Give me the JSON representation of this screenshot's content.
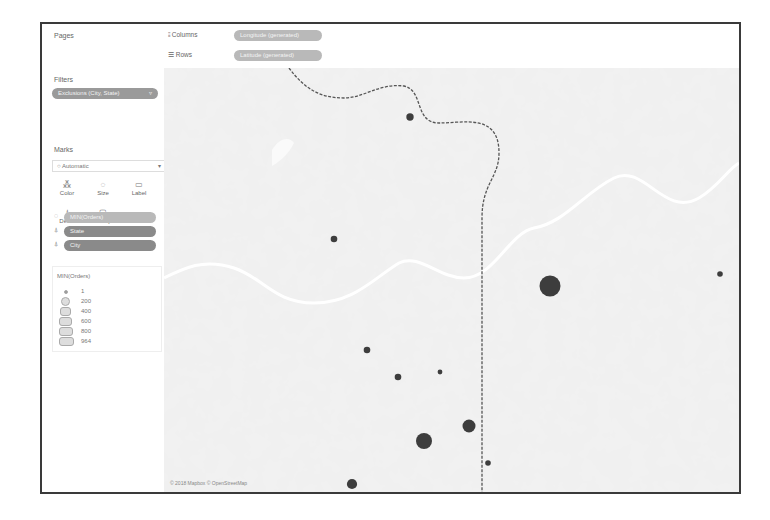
{
  "sidebar": {
    "pages_title": "Pages",
    "filters_title": "Filters",
    "filter_pill": "Exclusions (City, State)",
    "filter_icon": "filter-icon",
    "marks_title": "Marks",
    "mark_type": "Automatic",
    "mark_buttons": [
      {
        "label": "Color",
        "icon": "color-icon"
      },
      {
        "label": "Size",
        "icon": "size-icon"
      },
      {
        "label": "Label",
        "icon": "label-icon"
      },
      {
        "label": "Detail",
        "icon": "detail-icon"
      },
      {
        "label": "Tooltip",
        "icon": "tooltip-icon"
      }
    ],
    "mark_pills": [
      {
        "label": "MIN(Orders)",
        "icon": "size-icon"
      },
      {
        "label": "State",
        "icon": "detail-icon"
      },
      {
        "label": "City",
        "icon": "detail-icon"
      }
    ],
    "legend": {
      "title": "MIN(Orders)",
      "items": [
        "1",
        "200",
        "400",
        "600",
        "800",
        "964"
      ]
    }
  },
  "shelves": {
    "columns_label": "Columns",
    "columns_pill": "Longitude (generated)",
    "rows_label": "Rows",
    "rows_pill": "Latitude (generated)"
  },
  "map": {
    "attribution": "© 2018 Mapbox © OpenStreetMap",
    "mark_color": "#3d3d3d",
    "points": [
      {
        "name": "point-1",
        "orders": 60
      },
      {
        "name": "point-2",
        "orders": 40
      },
      {
        "name": "point-3",
        "orders": 964
      },
      {
        "name": "point-4",
        "orders": 20
      },
      {
        "name": "point-5",
        "orders": 40
      },
      {
        "name": "point-6",
        "orders": 40
      },
      {
        "name": "point-7",
        "orders": 10
      },
      {
        "name": "point-8",
        "orders": 500
      },
      {
        "name": "point-9",
        "orders": 300
      },
      {
        "name": "point-10",
        "orders": 20
      },
      {
        "name": "point-11",
        "orders": 150
      }
    ]
  }
}
